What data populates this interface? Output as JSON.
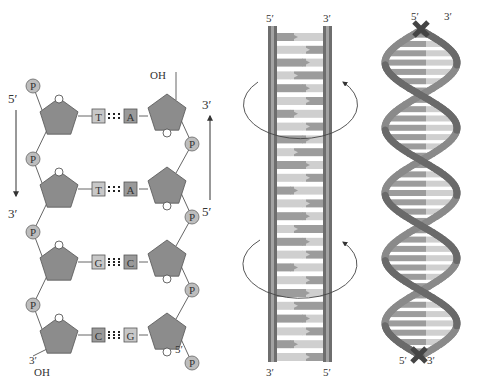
{
  "colors": {
    "sugar_fill": "#8c8c8c",
    "sugar_stroke": "#555555",
    "phosphate_fill": "#bdbdbd",
    "phosphate_stroke": "#666666",
    "base_light": "#c8c8c8",
    "base_dark": "#9a9a9a",
    "backbone_dark": "#6e6e6e",
    "backbone_mid": "#8f8f8f",
    "rung_dark": "#9c9c9c",
    "rung_light": "#cfcfcf",
    "line": "#666666",
    "text": "#333333"
  },
  "chemical_structure": {
    "left_strand": {
      "top_label": "5′",
      "bottom_label": "3′",
      "terminal_label": "3′",
      "terminal_group": "OH"
    },
    "right_strand": {
      "top_label": "3′",
      "bottom_label": "5′",
      "terminal_label": "5′",
      "terminal_group": "OH"
    },
    "phosphate_label": "P",
    "ring_oxygen_label": "O",
    "base_pairs": [
      {
        "left": "T",
        "right": "A"
      },
      {
        "left": "T",
        "right": "A"
      },
      {
        "left": "G",
        "right": "C"
      },
      {
        "left": "C",
        "right": "G"
      }
    ]
  },
  "ladder": {
    "top_left_label": "5′",
    "top_right_label": "3′",
    "bottom_left_label": "3′",
    "bottom_right_label": "5′",
    "rung_count": 26,
    "twist_arrows": [
      "upper-twist",
      "lower-twist"
    ]
  },
  "helix": {
    "top_left_label": "5′",
    "top_right_label": "3′",
    "bottom_left_label": "5′",
    "bottom_right_label": "3′",
    "turns": 2.5
  }
}
